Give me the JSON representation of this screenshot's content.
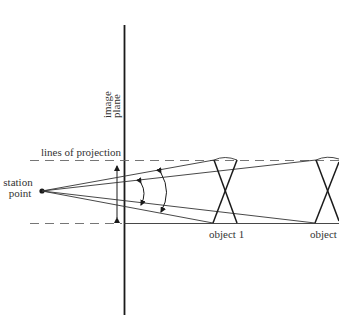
{
  "diagram": {
    "labels": {
      "image_plane_line1": "image",
      "image_plane_line2": "plane",
      "lines_of_projection": "lines of projection",
      "station_line1": "station",
      "station_line2": "point",
      "object1": "object 1",
      "object2": "object"
    },
    "colors": {
      "line": "#1a1a1a",
      "dashed": "#555555",
      "text": "#333333"
    }
  }
}
